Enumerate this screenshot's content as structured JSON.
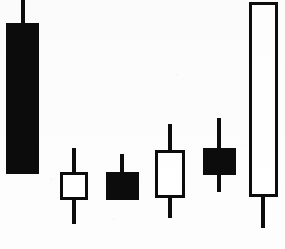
{
  "chart_data": {
    "type": "candlestick",
    "title": "",
    "subtitle": "",
    "xlabel": "",
    "ylabel": "",
    "grid": false,
    "axis_visible": false,
    "legend": null,
    "annotations": [],
    "colors": {
      "bearish_fill": "#0c0c0c",
      "bullish_fill": "#ffffff",
      "outline": "#0c0c0c",
      "background": "#fdfdfd"
    },
    "y_axis_orientation": "price-increases-upward",
    "pixel_reference": {
      "note": "y pixel coordinates measured from top of 285x249 image",
      "image_width": 285,
      "image_height": 249
    },
    "categories": [
      "1",
      "2",
      "3",
      "4",
      "5",
      "6"
    ],
    "candles": [
      {
        "index": 1,
        "label": "1",
        "direction": "bearish",
        "fill": "filled",
        "body_color": "#0c0c0c",
        "center_x": 23,
        "body_left": 6,
        "body_width": 33,
        "body_top": 23,
        "body_bottom": 174,
        "wick_top": 0,
        "wick_bottom": 174,
        "has_upper_wick": true,
        "has_lower_wick": false,
        "open_px": 23,
        "close_px": 174,
        "high_px": 0,
        "low_px": 174
      },
      {
        "index": 2,
        "label": "2",
        "direction": "bullish",
        "fill": "hollow",
        "body_color": "#ffffff",
        "center_x": 74,
        "body_left": 60,
        "body_width": 28,
        "body_top": 172,
        "body_bottom": 200,
        "wick_top": 148,
        "wick_bottom": 224,
        "has_upper_wick": true,
        "has_lower_wick": true,
        "open_px": 200,
        "close_px": 172,
        "high_px": 148,
        "low_px": 224
      },
      {
        "index": 3,
        "label": "3",
        "direction": "bearish",
        "fill": "filled",
        "body_color": "#0c0c0c",
        "center_x": 122,
        "body_left": 106,
        "body_width": 33,
        "body_top": 172,
        "body_bottom": 200,
        "wick_top": 154,
        "wick_bottom": 200,
        "has_upper_wick": true,
        "has_lower_wick": false,
        "open_px": 172,
        "close_px": 200,
        "high_px": 154,
        "low_px": 200
      },
      {
        "index": 4,
        "label": "4",
        "direction": "bullish",
        "fill": "hollow",
        "body_color": "#ffffff",
        "center_x": 170,
        "body_left": 155,
        "body_width": 30,
        "body_top": 150,
        "body_bottom": 198,
        "wick_top": 124,
        "wick_bottom": 218,
        "has_upper_wick": true,
        "has_lower_wick": true,
        "open_px": 198,
        "close_px": 150,
        "high_px": 124,
        "low_px": 218
      },
      {
        "index": 5,
        "label": "5",
        "direction": "bearish",
        "fill": "filled",
        "body_color": "#0c0c0c",
        "center_x": 219,
        "body_left": 203,
        "body_width": 33,
        "body_top": 148,
        "body_bottom": 175,
        "wick_top": 118,
        "wick_bottom": 192,
        "has_upper_wick": true,
        "has_lower_wick": true,
        "open_px": 148,
        "close_px": 175,
        "high_px": 118,
        "low_px": 192
      },
      {
        "index": 6,
        "label": "6",
        "direction": "bullish",
        "fill": "hollow",
        "body_color": "#ffffff",
        "center_x": 263,
        "body_left": 249,
        "body_width": 29,
        "body_top": 2,
        "body_bottom": 197,
        "wick_top": 2,
        "wick_bottom": 228,
        "has_upper_wick": false,
        "has_lower_wick": true,
        "open_px": 197,
        "close_px": 2,
        "high_px": 2,
        "low_px": 228
      }
    ]
  }
}
